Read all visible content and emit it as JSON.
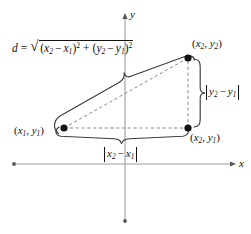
{
  "figure": {
    "axes": {
      "x_label": "x",
      "y_label": "y",
      "x_axis_y": 164,
      "y_axis_x": 125
    },
    "colors": {
      "stroke": "#444444",
      "axis": "#9aa0a6",
      "point": "#111111",
      "dashed": "#8a8a8a",
      "text": "#111111"
    },
    "points": [
      {
        "id": "p1",
        "label_plain": "(x1, y1)",
        "label_open": "(",
        "label_var1": "x",
        "label_sub1": "1",
        "label_comma": ", ",
        "label_var2": "y",
        "label_sub2": "1",
        "label_close": ")",
        "px": 64,
        "py": 128
      },
      {
        "id": "p2",
        "label_plain": "(x2, y2)",
        "label_open": "(",
        "label_var1": "x",
        "label_sub1": "2",
        "label_comma": ", ",
        "label_var2": "y",
        "label_sub2": "2",
        "label_close": ")",
        "px": 188,
        "py": 58
      },
      {
        "id": "p3",
        "label_plain": "(x2, y1)",
        "label_open": "(",
        "label_var1": "x",
        "label_sub1": "2",
        "label_comma": ", ",
        "label_var2": "y",
        "label_sub2": "1",
        "label_close": ")",
        "px": 188,
        "py": 128
      }
    ],
    "formula": {
      "lhs": "d",
      "equals": "=",
      "radical": "√",
      "term1_open": "(",
      "term1_var_a": "x",
      "term1_sub_a": "2",
      "term1_minus": "−",
      "term1_var_b": "x",
      "term1_sub_b": "1",
      "term1_close": ")",
      "term1_power": "2",
      "plus": "+",
      "term2_open": "(",
      "term2_var_a": "y",
      "term2_sub_a": "2",
      "term2_minus": "−",
      "term2_var_b": "y",
      "term2_sub_b": "1",
      "term2_close": ")",
      "term2_power": "2",
      "full_text": "d = sqrt((x2 - x1)^2 + (y2 - y1)^2)"
    },
    "braces": {
      "vertical": {
        "name": "vertical-leg-brace",
        "label_var_a": "y",
        "label_sub_a": "2",
        "label_minus": "−",
        "label_var_b": "y",
        "label_sub_b": "1",
        "label_plain": "|y2 - y1|"
      },
      "horizontal": {
        "name": "horizontal-leg-brace",
        "label_var_a": "x",
        "label_sub_a": "2",
        "label_minus": "−",
        "label_var_b": "x",
        "label_sub_b": "1",
        "label_plain": "|x2 - x1|"
      },
      "hypotenuse": {
        "name": "hypotenuse-brace",
        "label_plain": "d"
      }
    }
  }
}
